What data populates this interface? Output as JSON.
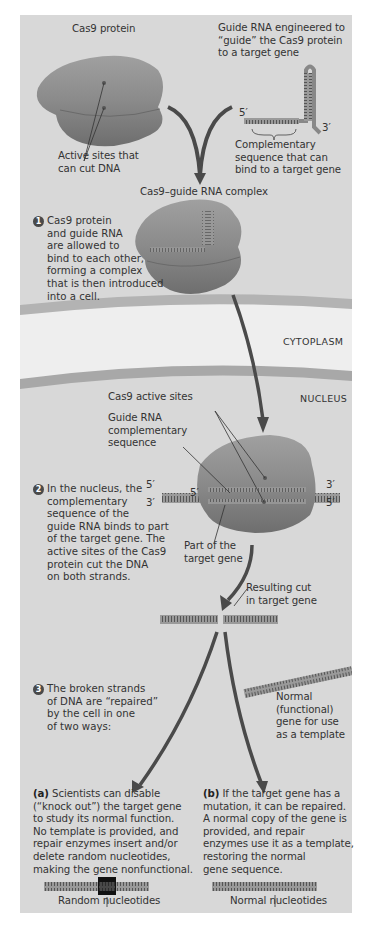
{
  "figure": {
    "labels": {
      "cas9_protein": "Cas9 protein",
      "guide_rna": "Guide RNA engineered to\n“guide” the Cas9 protein\nto a target gene",
      "active_sites": "Active sites that\ncan cut DNA",
      "complementary_seq": "Complementary\nsequence that can\nbind to a target gene",
      "five_prime": "5′",
      "three_prime": "3′",
      "complex_title": "Cas9–guide RNA complex",
      "cytoplasm": "CYTOPLASM",
      "nucleus": "NUCLEUS",
      "cas9_active_sites": "Cas9 active sites",
      "guide_rna_complementary": "Guide RNA\ncomplementary\nsequence",
      "part_of_target": "Part of the\ntarget gene",
      "resulting_cut": "Resulting cut\nin target gene",
      "normal_gene": "Normal\n(functional)\ngene for use\nas a template",
      "random_nucleotides": "Random nucleotides",
      "normal_nucleotides": "Normal nucleotides"
    },
    "steps": [
      {
        "num": "1",
        "text_first": "Cas9 protein",
        "text_rest": "and guide RNA\nare allowed to\nbind to each other,\nforming a complex\nthat is then introduced\ninto a cell."
      },
      {
        "num": "2",
        "text_first": "In the nucleus, the",
        "text_rest": "complementary\nsequence of the\nguide RNA binds to part\nof the target gene. The\nactive sites of the Cas9\nprotein cut the DNA\non both strands."
      },
      {
        "num": "3",
        "text_first": "The broken strands",
        "text_rest": "of DNA are “repaired”\nby the cell in one\nof two ways:"
      }
    ],
    "outcomes": {
      "a": {
        "tag": "(a)",
        "text_first": " Scientists can disable",
        "text_rest": "(“knock out”) the target gene\nto study its normal function.\nNo template is provided, and\nrepair enzymes insert and/or\ndelete random nucleotides,\nmaking the gene nonfunctional."
      },
      "b": {
        "tag": "(b)",
        "text_first": " If the target gene has a",
        "text_rest": "mutation, it can be repaired.\nA normal copy of the gene is\nprovided, and repair\nenzymes use it as a template,\nrestoring the normal\ngene sequence."
      }
    },
    "colors": {
      "panel": "#d8d8d8",
      "protein": "#8c8c8c",
      "arrow": "#4a4a4a",
      "membrane": "#b0b0b0"
    }
  }
}
